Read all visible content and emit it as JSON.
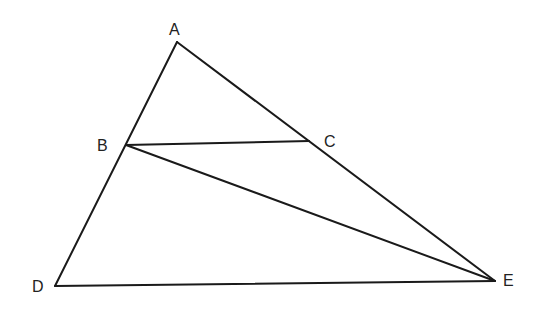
{
  "diagram": {
    "type": "triangle-geometry",
    "points": {
      "A": {
        "label": "A",
        "x": 177,
        "y": 42,
        "label_x": 169,
        "label_y": 35
      },
      "B": {
        "label": "B",
        "x": 126,
        "y": 145,
        "label_x": 97,
        "label_y": 151
      },
      "C": {
        "label": "C",
        "x": 309,
        "y": 141,
        "label_x": 324,
        "label_y": 147
      },
      "D": {
        "label": "D",
        "x": 55,
        "y": 286,
        "label_x": 32,
        "label_y": 292
      },
      "E": {
        "label": "E",
        "x": 495,
        "y": 281,
        "label_x": 503,
        "label_y": 286
      }
    },
    "segments": [
      [
        "A",
        "D"
      ],
      [
        "A",
        "E"
      ],
      [
        "D",
        "E"
      ],
      [
        "B",
        "C"
      ],
      [
        "B",
        "E"
      ]
    ],
    "stroke_color": "#1a1a1a"
  }
}
